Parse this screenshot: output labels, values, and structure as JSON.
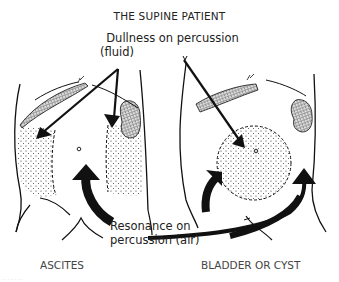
{
  "title": "THE SUPINE PATIENT",
  "labels": {
    "dullness_line1": "Dullness on percussion",
    "dullness_line2": "(fluid)",
    "resonance_line1": "Resonance on",
    "resonance_line2": "percussion (air)"
  },
  "captions": {
    "left": "ASCITES",
    "right": "BLADDER OR CYST"
  },
  "watermark": "· · ·  · · · ·"
}
